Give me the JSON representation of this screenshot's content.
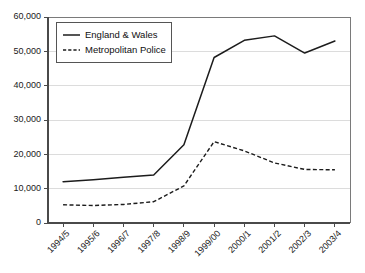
{
  "chart_data": {
    "type": "line",
    "title": "",
    "subtitle": "",
    "xlabel": "",
    "ylabel": "",
    "ylim": [
      0,
      60000
    ],
    "yticks": [
      0,
      10000,
      20000,
      30000,
      40000,
      50000,
      60000
    ],
    "ytick_labels": [
      "0",
      "10,000",
      "20,000",
      "30,000",
      "40,000",
      "50,000",
      "60,000"
    ],
    "grid": true,
    "legend_position": "upper-left-inside",
    "categories": [
      "1994/5",
      "1995/6",
      "1996/7",
      "1997/8",
      "1998/9",
      "1999/00",
      "2000/1",
      "2001/2",
      "2002/3",
      "2003/4"
    ],
    "series": [
      {
        "name": "England & Wales",
        "style": "solid",
        "color": "#1c1c1c",
        "values": [
          12000,
          12600,
          13300,
          14000,
          22800,
          48200,
          53200,
          54500,
          49500,
          53000
        ]
      },
      {
        "name": "Metropolitan Police",
        "style": "dashed",
        "color": "#1c1c1c",
        "values": [
          5300,
          5100,
          5400,
          6200,
          10800,
          23700,
          21000,
          17500,
          15600,
          15500
        ]
      }
    ]
  },
  "legend": {
    "entries": [
      {
        "label": "England & Wales",
        "style": "solid"
      },
      {
        "label": "Metropolitan Police",
        "style": "dashed"
      }
    ]
  },
  "colors": {
    "line": "#1c1c1c",
    "grid": "#d3d3d3",
    "axis": "#4a4a4a",
    "frame": "#7a7a7a",
    "background": "#ffffff",
    "text": "#1a1a1a"
  }
}
